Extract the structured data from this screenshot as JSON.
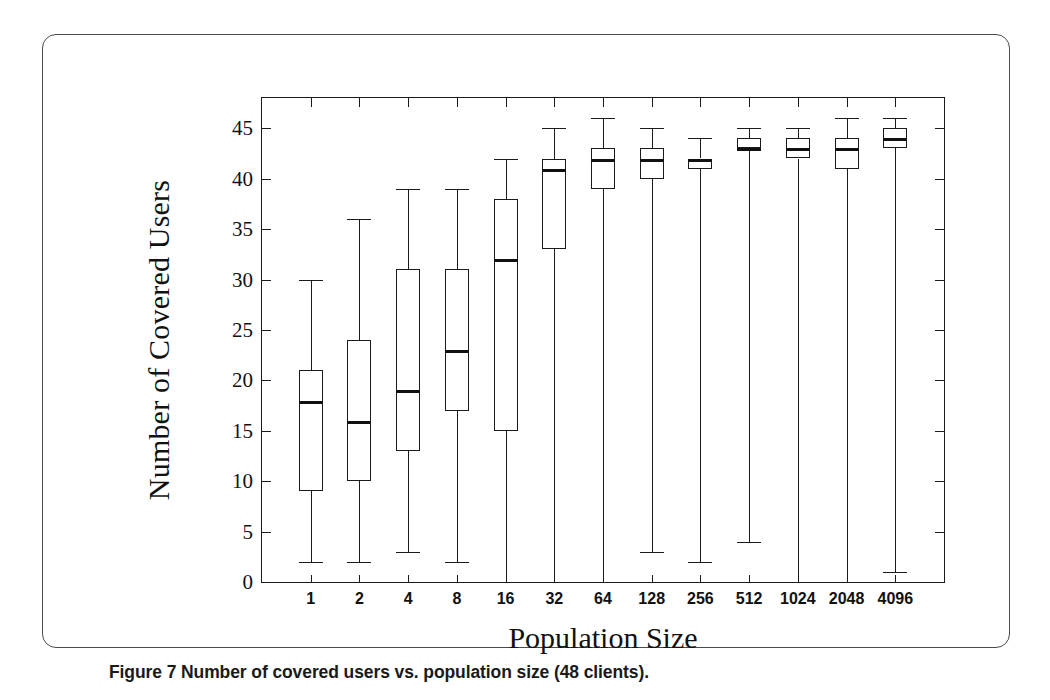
{
  "figure": {
    "caption": "Figure 7 Number of covered users vs. population size (48 clients)."
  },
  "chart_data": {
    "type": "box",
    "title": "",
    "xlabel": "Population Size",
    "ylabel": "Number of Covered Users",
    "categories": [
      "1",
      "2",
      "4",
      "8",
      "16",
      "32",
      "64",
      "128",
      "256",
      "512",
      "1024",
      "2048",
      "4096"
    ],
    "ylim": [
      0,
      48
    ],
    "yticks": [
      0,
      5,
      10,
      15,
      20,
      25,
      30,
      35,
      40,
      45
    ],
    "ytick_labels": [
      "0",
      "5",
      "10",
      "15",
      "20",
      "25",
      "30",
      "35",
      "40",
      "45"
    ],
    "grid": false,
    "legend": null,
    "boxes": [
      {
        "category": "1",
        "whisker_low": 2,
        "q1": 9,
        "median": 18,
        "q3": 21,
        "whisker_high": 30
      },
      {
        "category": "2",
        "whisker_low": 2,
        "q1": 10,
        "median": 16,
        "q3": 24,
        "whisker_high": 36
      },
      {
        "category": "4",
        "whisker_low": 3,
        "q1": 13,
        "median": 19,
        "q3": 31,
        "whisker_high": 39
      },
      {
        "category": "8",
        "whisker_low": 2,
        "q1": 17,
        "median": 23,
        "q3": 31,
        "whisker_high": 39
      },
      {
        "category": "16",
        "whisker_low": 0,
        "q1": 15,
        "median": 32,
        "q3": 38,
        "whisker_high": 42
      },
      {
        "category": "32",
        "whisker_low": 0,
        "q1": 33,
        "median": 41,
        "q3": 42,
        "whisker_high": 45
      },
      {
        "category": "64",
        "whisker_low": 0,
        "q1": 39,
        "median": 42,
        "q3": 43,
        "whisker_high": 46
      },
      {
        "category": "128",
        "whisker_low": 3,
        "q1": 40,
        "median": 42,
        "q3": 43,
        "whisker_high": 45
      },
      {
        "category": "256",
        "whisker_low": 2,
        "q1": 41,
        "median": 42,
        "q3": 42,
        "whisker_high": 44
      },
      {
        "category": "512",
        "whisker_low": 4,
        "q1": 43,
        "median": 43,
        "q3": 44,
        "whisker_high": 45
      },
      {
        "category": "1024",
        "whisker_low": 0,
        "q1": 42,
        "median": 43,
        "q3": 44,
        "whisker_high": 45
      },
      {
        "category": "2048",
        "whisker_low": 0,
        "q1": 41,
        "median": 43,
        "q3": 44,
        "whisker_high": 46
      },
      {
        "category": "4096",
        "whisker_low": 1,
        "q1": 43,
        "median": 44,
        "q3": 45,
        "whisker_high": 46
      }
    ]
  }
}
